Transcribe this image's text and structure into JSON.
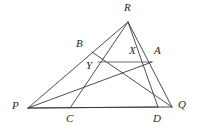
{
  "figure": {
    "background_color": "#ffffff",
    "stroke_color": "#3a3a3a",
    "label_color": "#262626",
    "width": 200,
    "height": 131
  },
  "points": {
    "P": {
      "label": "P",
      "x": 28,
      "y": 108,
      "label_x": 12,
      "label_y": 100
    },
    "Q": {
      "label": "Q",
      "x": 172,
      "y": 107,
      "label_x": 178,
      "label_y": 99
    },
    "R": {
      "label": "R",
      "x": 128,
      "y": 22,
      "label_x": 124,
      "label_y": 2
    },
    "A": {
      "label": "A",
      "x": 152,
      "y": 62,
      "label_x": 154,
      "label_y": 45
    },
    "B": {
      "label": "B",
      "x": 92,
      "y": 52,
      "label_x": 76,
      "label_y": 38
    },
    "C": {
      "label": "C",
      "x": 70,
      "y": 108,
      "label_x": 66,
      "label_y": 113
    },
    "D": {
      "label": "D",
      "x": 158,
      "y": 107,
      "label_x": 153,
      "label_y": 113
    },
    "X": {
      "label": "X",
      "x": 133,
      "y": 62,
      "label_x": 129,
      "label_y": 45
    },
    "Y": {
      "label": "Y",
      "x": 98,
      "y": 62,
      "label_x": 86,
      "label_y": 60
    }
  },
  "segments": [
    {
      "name": "side-PQ",
      "from": "P",
      "to": "Q"
    },
    {
      "name": "side-PR",
      "from": "P",
      "to": "R"
    },
    {
      "name": "side-RQ",
      "from": "R",
      "to": "Q"
    },
    {
      "name": "cevian-RC",
      "from": "R",
      "to": "C"
    },
    {
      "name": "cevian-RD",
      "from": "R",
      "to": "D"
    },
    {
      "name": "cevian-PA",
      "from": "P",
      "to": "A"
    },
    {
      "name": "cevian-PD",
      "from": "P",
      "to": "D"
    },
    {
      "name": "cevian-BQ",
      "from": "B",
      "to": "Q"
    },
    {
      "name": "segment-YA",
      "from": "Y",
      "to": "A"
    }
  ]
}
